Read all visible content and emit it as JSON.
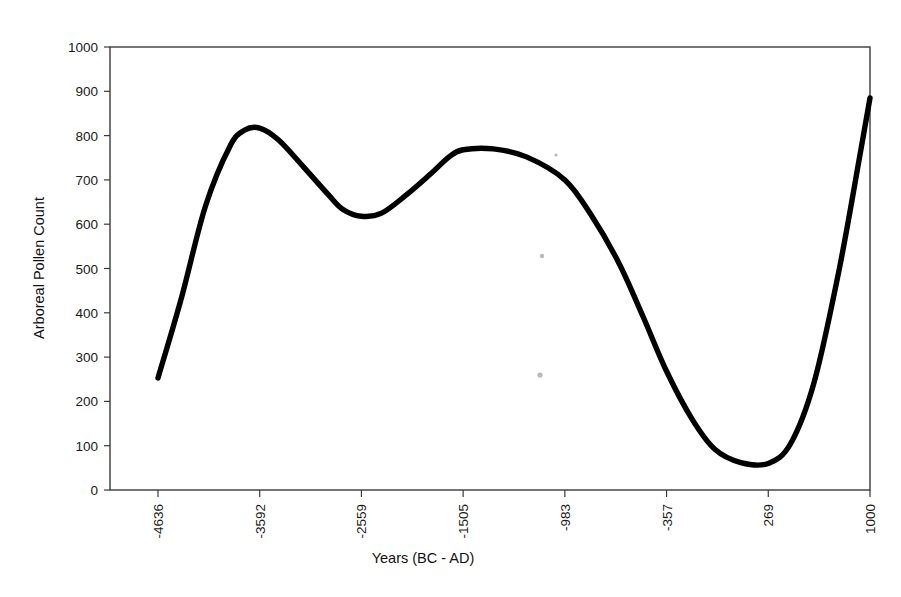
{
  "chart_data": {
    "type": "line",
    "title": "",
    "xlabel": "Years (BC - AD)",
    "ylabel": "Arboreal Pollen Count",
    "x_tick_labels": [
      "-4636",
      "-3592",
      "-2559",
      "-1505",
      "-983",
      "-357",
      "269",
      "1000"
    ],
    "x_tick_values": [
      -4636,
      -3592,
      -2559,
      -1505,
      -983,
      -357,
      269,
      1000
    ],
    "y_tick_labels": [
      "0",
      "100",
      "200",
      "300",
      "400",
      "500",
      "600",
      "700",
      "800",
      "900",
      "1000"
    ],
    "y_tick_values": [
      0,
      100,
      200,
      300,
      400,
      500,
      600,
      700,
      800,
      900,
      1000
    ],
    "ylim": [
      0,
      1000
    ],
    "grid": false,
    "legend": "none",
    "series": [
      {
        "name": "Arboreal Pollen Count",
        "color": "#000000",
        "x": [
          -4636,
          -4400,
          -4150,
          -3900,
          -3750,
          -3592,
          -3400,
          -3150,
          -2900,
          -2750,
          -2559,
          -2350,
          -2100,
          -1850,
          -1650,
          -1505,
          -1350,
          -1180,
          -983,
          -820,
          -650,
          -500,
          -357,
          -200,
          -60,
          100,
          269,
          430,
          600,
          780,
          930,
          1000
        ],
        "values": [
          253,
          430,
          640,
          775,
          812,
          817,
          790,
          730,
          668,
          634,
          618,
          625,
          665,
          712,
          752,
          768,
          770,
          752,
          700,
          620,
          512,
          390,
          268,
          160,
          92,
          62,
          60,
          105,
          245,
          500,
          760,
          885
        ]
      }
    ],
    "annotations": []
  },
  "figure": {
    "background": "#ffffff",
    "axis_color": "#3a3a3a",
    "line_color": "#000000"
  }
}
